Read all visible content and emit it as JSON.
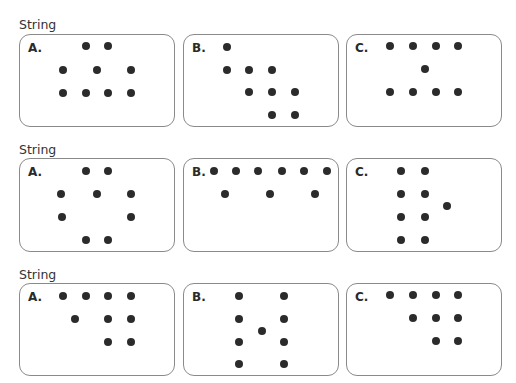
{
  "sections": [
    {
      "label": "String",
      "label_top": 18,
      "panels": [
        {
          "letter": "A.",
          "box": [
            19,
            34,
            156,
            93
          ],
          "dots": [
            [
              86,
              46
            ],
            [
              108,
              46
            ],
            [
              63,
              70
            ],
            [
              97,
              70
            ],
            [
              131,
              70
            ],
            [
              63,
              93
            ],
            [
              86,
              93
            ],
            [
              108,
              93
            ],
            [
              131,
              93
            ]
          ]
        },
        {
          "letter": "B.",
          "box": [
            183,
            34,
            156,
            93
          ],
          "dots": [
            [
              227,
              47
            ],
            [
              227,
              70
            ],
            [
              249,
              70
            ],
            [
              272,
              70
            ],
            [
              249,
              92
            ],
            [
              272,
              92
            ],
            [
              295,
              92
            ],
            [
              272,
              115
            ],
            [
              295,
              115
            ]
          ]
        },
        {
          "letter": "C.",
          "box": [
            346,
            34,
            156,
            93
          ],
          "dots": [
            [
              390,
              46
            ],
            [
              413,
              46
            ],
            [
              436,
              46
            ],
            [
              458,
              46
            ],
            [
              425,
              69
            ],
            [
              390,
              92
            ],
            [
              413,
              92
            ],
            [
              436,
              92
            ],
            [
              458,
              92
            ]
          ]
        }
      ]
    },
    {
      "label": "String",
      "label_top": 143,
      "panels": [
        {
          "letter": "A.",
          "box": [
            19,
            158,
            156,
            94
          ],
          "dots": [
            [
              86,
              171
            ],
            [
              108,
              171
            ],
            [
              61,
              194
            ],
            [
              97,
              194
            ],
            [
              131,
              194
            ],
            [
              62,
              217
            ],
            [
              131,
              217
            ],
            [
              86,
              240
            ],
            [
              108,
              240
            ]
          ]
        },
        {
          "letter": "B.",
          "box": [
            183,
            158,
            156,
            94
          ],
          "dots": [
            [
              214,
              171
            ],
            [
              236,
              171
            ],
            [
              258,
              171
            ],
            [
              282,
              171
            ],
            [
              304,
              171
            ],
            [
              327,
              171
            ],
            [
              225,
              194
            ],
            [
              270,
              194
            ],
            [
              315,
              194
            ]
          ]
        },
        {
          "letter": "C.",
          "box": [
            346,
            158,
            156,
            94
          ],
          "dots": [
            [
              401,
              171
            ],
            [
              425,
              171
            ],
            [
              401,
              194
            ],
            [
              425,
              194
            ],
            [
              447,
              206
            ],
            [
              401,
              217
            ],
            [
              425,
              217
            ],
            [
              401,
              240
            ],
            [
              425,
              240
            ]
          ]
        }
      ]
    },
    {
      "label": "String",
      "label_top": 268,
      "panels": [
        {
          "letter": "A.",
          "box": [
            19,
            283,
            156,
            93
          ],
          "dots": [
            [
              63,
              296
            ],
            [
              86,
              296
            ],
            [
              108,
              296
            ],
            [
              131,
              296
            ],
            [
              75,
              319
            ],
            [
              108,
              319
            ],
            [
              131,
              319
            ],
            [
              108,
              342
            ],
            [
              131,
              342
            ]
          ]
        },
        {
          "letter": "B.",
          "box": [
            183,
            283,
            156,
            93
          ],
          "dots": [
            [
              239,
              296
            ],
            [
              284,
              296
            ],
            [
              239,
              319
            ],
            [
              284,
              319
            ],
            [
              262,
              331
            ],
            [
              239,
              342
            ],
            [
              284,
              342
            ],
            [
              239,
              364
            ],
            [
              284,
              364
            ]
          ]
        },
        {
          "letter": "C.",
          "box": [
            346,
            283,
            156,
            93
          ],
          "dots": [
            [
              390,
              295
            ],
            [
              413,
              295
            ],
            [
              436,
              295
            ],
            [
              458,
              295
            ],
            [
              413,
              318
            ],
            [
              436,
              318
            ],
            [
              458,
              318
            ],
            [
              436,
              341
            ],
            [
              458,
              341
            ]
          ]
        }
      ]
    }
  ],
  "colors": {
    "dot": "#2b2b2b",
    "border": "#8a8a8a",
    "text": "#333333"
  }
}
